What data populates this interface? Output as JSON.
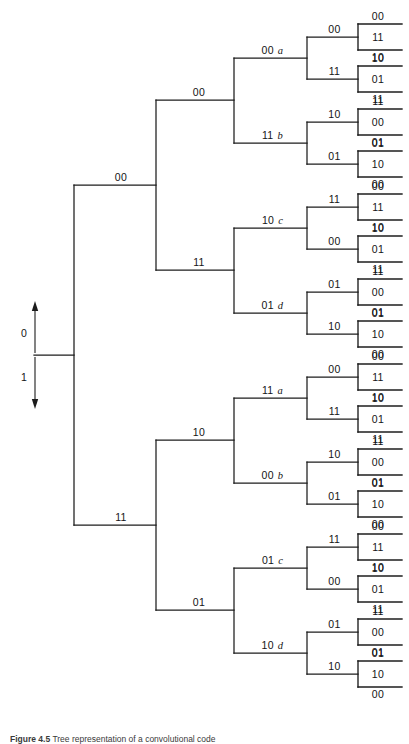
{
  "figure": {
    "caption_prefix": "Figure 4.5",
    "caption_text": "Tree representation of a convolutional code",
    "line_color": "#1c1c1c",
    "background": "#ffffff"
  },
  "root": {
    "up_label": "0",
    "down_label": "1",
    "x": 74,
    "y": 355
  },
  "geometry": {
    "x_root": 74,
    "x_l2": 156,
    "x_l3": 234,
    "x_l4": 307,
    "x_l5": 358,
    "x_leaf_end": 402,
    "leaf_arm_half": 13,
    "label_dy": -4
  },
  "tree": {
    "level2": [
      {
        "label": "00",
        "y": 185
      },
      {
        "label": "11",
        "y": 525
      }
    ],
    "level3": [
      {
        "label": "00",
        "y": 100,
        "parent": 0
      },
      {
        "label": "11",
        "y": 270,
        "parent": 0
      },
      {
        "label": "10",
        "y": 440,
        "parent": 1
      },
      {
        "label": "01",
        "y": 610,
        "parent": 1
      }
    ],
    "level4": [
      {
        "digits": "00",
        "suffix": "a",
        "y": 58,
        "parent": 0
      },
      {
        "digits": "11",
        "suffix": "b",
        "y": 143,
        "parent": 0
      },
      {
        "digits": "10",
        "suffix": "c",
        "y": 228,
        "parent": 1
      },
      {
        "digits": "01",
        "suffix": "d",
        "y": 313,
        "parent": 1
      },
      {
        "digits": "11",
        "suffix": "a",
        "y": 398,
        "parent": 2
      },
      {
        "digits": "00",
        "suffix": "b",
        "y": 483,
        "parent": 2
      },
      {
        "digits": "01",
        "suffix": "c",
        "y": 568,
        "parent": 3
      },
      {
        "digits": "10",
        "suffix": "d",
        "y": 653,
        "parent": 3
      }
    ],
    "level5": [
      {
        "label": "00",
        "y": 37,
        "parent": 0
      },
      {
        "label": "11",
        "y": 79,
        "parent": 0
      },
      {
        "label": "10",
        "y": 122,
        "parent": 1
      },
      {
        "label": "01",
        "y": 164,
        "parent": 1
      },
      {
        "label": "11",
        "y": 207,
        "parent": 2
      },
      {
        "label": "00",
        "y": 249,
        "parent": 2
      },
      {
        "label": "01",
        "y": 292,
        "parent": 3
      },
      {
        "label": "10",
        "y": 334,
        "parent": 3
      },
      {
        "label": "00",
        "y": 377,
        "parent": 4
      },
      {
        "label": "11",
        "y": 419,
        "parent": 4
      },
      {
        "label": "10",
        "y": 462,
        "parent": 5
      },
      {
        "label": "01",
        "y": 504,
        "parent": 5
      },
      {
        "label": "11",
        "y": 547,
        "parent": 6
      },
      {
        "label": "00",
        "y": 589,
        "parent": 6
      },
      {
        "label": "01",
        "y": 632,
        "parent": 7
      },
      {
        "label": "10",
        "y": 674,
        "parent": 7
      }
    ],
    "leaves": [
      {
        "above": "00",
        "inside": "11",
        "below": "10",
        "y": 37
      },
      {
        "above": "10",
        "inside": "01",
        "below": "11",
        "y": 79
      },
      {
        "above": "11",
        "inside": "00",
        "below": "01",
        "y": 122
      },
      {
        "above": "01",
        "inside": "10",
        "below": "00",
        "y": 164
      },
      {
        "above": "00",
        "inside": "11",
        "below": "10",
        "y": 207
      },
      {
        "above": "10",
        "inside": "01",
        "below": "11",
        "y": 249
      },
      {
        "above": "11",
        "inside": "00",
        "below": "01",
        "y": 292
      },
      {
        "above": "01",
        "inside": "10",
        "below": "00",
        "y": 334
      },
      {
        "above": "00",
        "inside": "11",
        "below": "10",
        "y": 377
      },
      {
        "above": "10",
        "inside": "01",
        "below": "11",
        "y": 419
      },
      {
        "above": "11",
        "inside": "00",
        "below": "01",
        "y": 462
      },
      {
        "above": "01",
        "inside": "10",
        "below": "00",
        "y": 504
      },
      {
        "above": "00",
        "inside": "11",
        "below": "10",
        "y": 547
      },
      {
        "above": "10",
        "inside": "01",
        "below": "11",
        "y": 589
      },
      {
        "above": "11",
        "inside": "00",
        "below": "01",
        "y": 632
      },
      {
        "above": "01",
        "inside": "10",
        "below": "00",
        "y": 674
      }
    ]
  }
}
